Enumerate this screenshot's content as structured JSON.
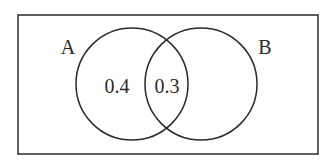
{
  "diagram": {
    "type": "venn",
    "universe": {
      "x": 18,
      "y": 15,
      "width": 300,
      "height": 139
    },
    "sets": [
      {
        "label": "A",
        "cx": 132,
        "cy": 84,
        "r": 56,
        "label_x": 68,
        "label_y": 54
      },
      {
        "label": "B",
        "cx": 201,
        "cy": 84,
        "r": 56,
        "label_x": 265,
        "label_y": 54
      }
    ],
    "regions": [
      {
        "name": "A only",
        "value": "0.4",
        "x": 117,
        "y": 93
      },
      {
        "name": "A and B",
        "value": "0.3",
        "x": 167,
        "y": 93
      }
    ],
    "stroke_color": "#2a2a2a"
  }
}
